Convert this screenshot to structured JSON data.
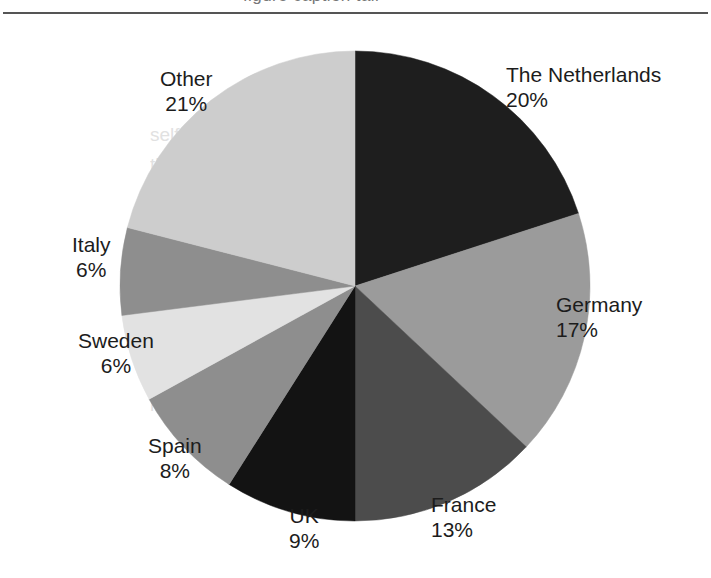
{
  "figure": {
    "partial_text_above_rule": "figure caption tail",
    "background_bleed_text": "self-evident\nthat international\nresearch is the\nmore effective\nbased in the\nof this task whereas it\nhas a specific research needs\nmore sources of  trade and investment\ncorporate research team\nresponsibilities"
  },
  "chart_data": {
    "type": "pie",
    "title": "",
    "subtitle": "",
    "xlabel": "",
    "ylabel": "",
    "legend_position": "none",
    "labels_on_slices": false,
    "label_format": "name + percent",
    "start_angle_deg": 0,
    "direction": "clockwise",
    "categories": [
      "The Netherlands",
      "Germany",
      "France",
      "UK",
      "Spain",
      "Sweden",
      "Italy",
      "Other"
    ],
    "values": [
      20,
      17,
      13,
      9,
      8,
      6,
      6,
      21
    ],
    "value_suffix": "%",
    "colors": [
      "#1e1e1e",
      "#9b9b9b",
      "#4c4c4c",
      "#131313",
      "#8e8e8e",
      "#e2e2e2",
      "#8e8e8e",
      "#cdcdcd"
    ],
    "slice_labels": [
      {
        "name": "The Netherlands",
        "value": "20%",
        "align": "left",
        "x": 506,
        "y": 62
      },
      {
        "name": "Germany",
        "value": "17%",
        "align": "left",
        "x": 556,
        "y": 292
      },
      {
        "name": "France",
        "value": "13%",
        "align": "left",
        "x": 431,
        "y": 492
      },
      {
        "name": "UK",
        "value": "9%",
        "align": "center",
        "x": 289,
        "y": 503
      },
      {
        "name": "Spain",
        "value": "8%",
        "align": "center",
        "x": 148,
        "y": 433
      },
      {
        "name": "Sweden",
        "value": "6%",
        "align": "center",
        "x": 78,
        "y": 328
      },
      {
        "name": "Italy",
        "value": "6%",
        "align": "center",
        "x": 72,
        "y": 232
      },
      {
        "name": "Other",
        "value": "21%",
        "align": "center",
        "x": 160,
        "y": 66
      }
    ]
  }
}
